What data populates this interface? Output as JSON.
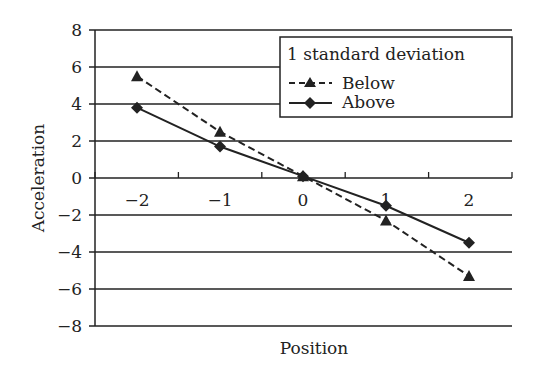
{
  "chart_data": {
    "type": "line",
    "title": "",
    "xlabel": "Position",
    "ylabel": "Acceleration",
    "categories": [
      "-2",
      "-1",
      "0",
      "1",
      "2"
    ],
    "x": [
      -2,
      -1,
      0,
      1,
      2
    ],
    "yticks": [
      8,
      6,
      4,
      2,
      0,
      -2,
      -4,
      -6,
      -8
    ],
    "ylim": [
      -8,
      8
    ],
    "grid": true,
    "legend": {
      "title": "1 standard deviation",
      "position": "upper right"
    },
    "series": [
      {
        "name": "Below",
        "style": "dashed",
        "marker": "triangle",
        "values": [
          5.5,
          2.5,
          0.1,
          -2.3,
          -5.3
        ]
      },
      {
        "name": "Above",
        "style": "solid",
        "marker": "diamond",
        "values": [
          3.8,
          1.7,
          0.1,
          -1.5,
          -3.5
        ]
      }
    ]
  }
}
